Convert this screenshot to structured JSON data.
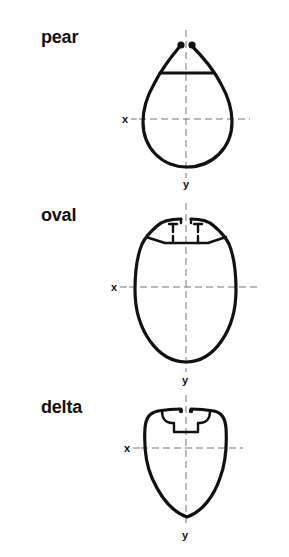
{
  "profiles": [
    {
      "name": "pear",
      "x_axis_label": "x",
      "y_axis_label": "y"
    },
    {
      "name": "oval",
      "x_axis_label": "x",
      "y_axis_label": "y"
    },
    {
      "name": "delta",
      "x_axis_label": "x",
      "y_axis_label": "y"
    }
  ],
  "colors": {
    "outline": "#111111",
    "axis": "#777777",
    "background": "#ffffff"
  }
}
